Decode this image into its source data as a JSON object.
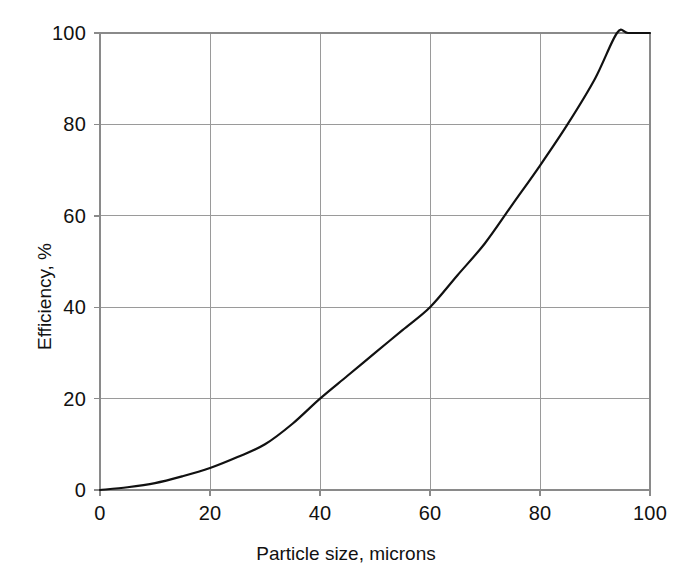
{
  "chart_data": {
    "type": "line",
    "title": "",
    "subtitle": "",
    "xlabel": "Particle size, microns",
    "ylabel": "Efficiency, %",
    "xlim": [
      0,
      100
    ],
    "ylim": [
      0,
      100
    ],
    "xticks": [
      0,
      20,
      40,
      60,
      80,
      100
    ],
    "yticks": [
      0,
      20,
      40,
      60,
      80,
      100
    ],
    "xtick_labels": [
      "0",
      "20",
      "40",
      "60",
      "80",
      "100"
    ],
    "ytick_labels": [
      "0",
      "20",
      "40",
      "60",
      "80",
      "100"
    ],
    "grid": true,
    "legend": null,
    "annotations": [],
    "series": [
      {
        "name": "Collection efficiency",
        "color": "#111111",
        "x": [
          0,
          5,
          10,
          15,
          20,
          25,
          30,
          35,
          40,
          45,
          50,
          55,
          60,
          65,
          70,
          75,
          80,
          85,
          90,
          94,
          96,
          100
        ],
        "y": [
          0,
          0.6,
          1.5,
          3.0,
          4.8,
          7.2,
          10.0,
          14.5,
          20.0,
          25.0,
          30.0,
          35.0,
          40.0,
          47.0,
          54.0,
          62.5,
          71.0,
          80.0,
          90.0,
          100.0,
          100.0,
          100.0
        ]
      }
    ]
  },
  "axes": {
    "spine_color": "#8a8a8a",
    "grid_color": "#9a9a9a",
    "curve_color": "#111111",
    "background": "#ffffff"
  },
  "plot_geometry": {
    "left_px": 100,
    "right_px": 650,
    "top_px": 33,
    "bottom_px": 490
  }
}
